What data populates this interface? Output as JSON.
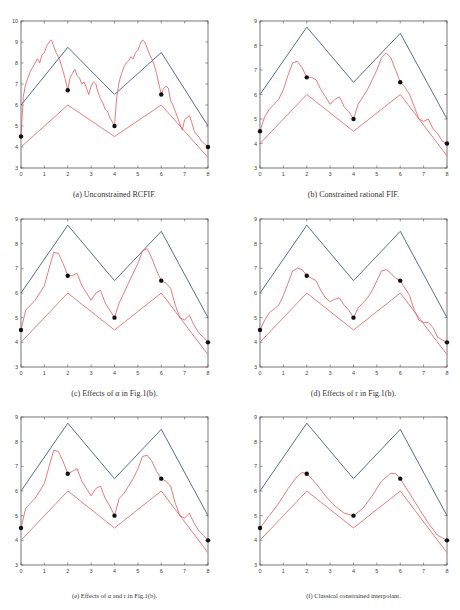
{
  "figure": {
    "point_color": "#111111",
    "upper_color": "#5a6a9a",
    "lower_color": "#e58080",
    "curve_color": "#e05a5a",
    "frame_color": "#555555"
  },
  "chart_data": [
    {
      "id": "a",
      "type": "line",
      "title": "",
      "caption": "(a) Unconstrained RCFIF.",
      "xlim": [
        0,
        8
      ],
      "ylim": [
        3,
        10
      ],
      "xticks": [
        0,
        1,
        2,
        3,
        4,
        5,
        6,
        7,
        8
      ],
      "yticks": [
        3,
        4,
        5,
        6,
        7,
        8,
        9,
        10
      ],
      "grid": false,
      "series": [
        {
          "name": "upper bound",
          "color": "#5a6a9a",
          "x": [
            0,
            2,
            4,
            6,
            8
          ],
          "y": [
            6,
            8.75,
            6.5,
            8.5,
            5
          ]
        },
        {
          "name": "lower bound",
          "color": "#e58080",
          "x": [
            0,
            2,
            4,
            6,
            8
          ],
          "y": [
            4,
            6,
            4.5,
            6,
            3.5
          ]
        },
        {
          "name": "fractal interpolant",
          "color": "#e05a5a",
          "x": [
            0,
            0.1,
            0.2,
            0.3,
            0.4,
            0.5,
            0.6,
            0.7,
            0.8,
            0.9,
            1.0,
            1.1,
            1.2,
            1.3,
            1.4,
            1.5,
            1.6,
            1.7,
            1.8,
            1.9,
            2.0,
            2.1,
            2.2,
            2.3,
            2.4,
            2.5,
            2.6,
            2.7,
            2.8,
            2.9,
            3.0,
            3.1,
            3.2,
            3.3,
            3.4,
            3.5,
            3.6,
            3.7,
            3.8,
            3.9,
            4.0,
            4.1,
            4.2,
            4.3,
            4.4,
            4.5,
            4.6,
            4.7,
            4.8,
            4.9,
            5.0,
            5.1,
            5.2,
            5.3,
            5.4,
            5.5,
            5.6,
            5.7,
            5.8,
            5.9,
            6.0,
            6.1,
            6.2,
            6.3,
            6.4,
            6.5,
            6.6,
            6.7,
            6.8,
            6.9,
            7.0,
            7.1,
            7.2,
            7.3,
            7.4,
            7.5,
            7.6,
            7.7,
            7.8,
            7.9,
            8.0
          ],
          "y": [
            4.5,
            6.4,
            7.0,
            7.3,
            7.6,
            7.8,
            8.0,
            8.2,
            8.0,
            8.4,
            8.5,
            8.8,
            9.0,
            9.1,
            8.8,
            8.5,
            8.3,
            8.0,
            7.6,
            7.2,
            6.7,
            7.3,
            7.5,
            7.7,
            7.4,
            7.3,
            7.0,
            7.1,
            6.8,
            6.5,
            6.9,
            7.1,
            7.0,
            6.6,
            6.3,
            6.1,
            5.8,
            5.7,
            5.4,
            5.2,
            5.0,
            6.4,
            7.1,
            7.5,
            7.8,
            8.0,
            8.1,
            8.3,
            8.2,
            8.5,
            8.6,
            8.9,
            9.1,
            9.0,
            8.7,
            8.4,
            8.2,
            7.9,
            7.5,
            7.0,
            6.5,
            6.8,
            6.9,
            6.8,
            6.2,
            6.0,
            5.7,
            5.4,
            5.1,
            4.8,
            5.3,
            5.4,
            5.5,
            5.2,
            4.8,
            4.6,
            4.5,
            4.3,
            4.2,
            4.1,
            4.0
          ]
        },
        {
          "name": "data points",
          "type": "scatter",
          "color": "#111111",
          "x": [
            0,
            2,
            4,
            6,
            8
          ],
          "y": [
            4.5,
            6.7,
            5,
            6.5,
            4
          ]
        }
      ]
    },
    {
      "id": "b",
      "type": "line",
      "caption": "(b) Constrained rational FIF.",
      "xlim": [
        0,
        8
      ],
      "ylim": [
        3,
        9
      ],
      "xticks": [
        0,
        1,
        2,
        3,
        4,
        5,
        6,
        7,
        8
      ],
      "yticks": [
        3,
        4,
        5,
        6,
        7,
        8,
        9
      ],
      "grid": false,
      "series": [
        {
          "name": "upper bound",
          "color": "#5a6a9a",
          "x": [
            0,
            2,
            4,
            6,
            8
          ],
          "y": [
            6,
            8.75,
            6.5,
            8.5,
            5
          ]
        },
        {
          "name": "lower bound",
          "color": "#e58080",
          "x": [
            0,
            2,
            4,
            6,
            8
          ],
          "y": [
            4,
            6,
            4.5,
            6,
            3.5
          ]
        },
        {
          "name": "fractal interpolant",
          "color": "#e05a5a",
          "x": [
            0,
            0.2,
            0.4,
            0.6,
            0.8,
            1.0,
            1.2,
            1.4,
            1.6,
            1.8,
            2.0,
            2.2,
            2.4,
            2.6,
            2.8,
            3.0,
            3.2,
            3.4,
            3.6,
            3.8,
            4.0,
            4.2,
            4.4,
            4.6,
            4.8,
            5.0,
            5.2,
            5.4,
            5.6,
            5.8,
            6.0,
            6.2,
            6.4,
            6.6,
            6.8,
            7.0,
            7.2,
            7.4,
            7.6,
            7.8,
            8.0
          ],
          "y": [
            4.5,
            5.1,
            5.4,
            5.6,
            5.8,
            6.2,
            6.8,
            7.3,
            7.35,
            7.1,
            6.7,
            6.7,
            6.6,
            6.2,
            5.9,
            5.6,
            5.8,
            5.9,
            5.5,
            5.3,
            5.0,
            5.6,
            5.9,
            6.2,
            6.6,
            7.0,
            7.5,
            7.7,
            7.5,
            7.0,
            6.5,
            6.3,
            6.0,
            5.5,
            5.0,
            4.9,
            5.0,
            4.6,
            4.4,
            4.1,
            4.0
          ]
        },
        {
          "name": "data points",
          "type": "scatter",
          "color": "#111111",
          "x": [
            0,
            2,
            4,
            6,
            8
          ],
          "y": [
            4.5,
            6.7,
            5,
            6.5,
            4
          ]
        }
      ]
    },
    {
      "id": "c",
      "type": "line",
      "caption": "(c) Effects of α in Fig.1(b).",
      "xlim": [
        0,
        8
      ],
      "ylim": [
        3,
        9
      ],
      "xticks": [
        0,
        1,
        2,
        3,
        4,
        5,
        6,
        7,
        8
      ],
      "yticks": [
        3,
        4,
        5,
        6,
        7,
        8,
        9
      ],
      "grid": false,
      "series": [
        {
          "name": "upper bound",
          "color": "#5a6a9a",
          "x": [
            0,
            2,
            4,
            6,
            8
          ],
          "y": [
            6,
            8.75,
            6.5,
            8.5,
            5
          ]
        },
        {
          "name": "lower bound",
          "color": "#e58080",
          "x": [
            0,
            2,
            4,
            6,
            8
          ],
          "y": [
            4,
            6,
            4.5,
            6,
            3.5
          ]
        },
        {
          "name": "fractal interpolant",
          "color": "#e05a5a",
          "x": [
            0,
            0.2,
            0.4,
            0.6,
            0.8,
            1.0,
            1.2,
            1.4,
            1.6,
            1.8,
            2.0,
            2.2,
            2.4,
            2.6,
            2.8,
            3.0,
            3.2,
            3.4,
            3.6,
            3.8,
            4.0,
            4.2,
            4.4,
            4.6,
            4.8,
            5.0,
            5.2,
            5.4,
            5.6,
            5.8,
            6.0,
            6.2,
            6.4,
            6.6,
            6.8,
            7.0,
            7.2,
            7.4,
            7.6,
            7.8,
            8.0
          ],
          "y": [
            4.5,
            5.3,
            5.5,
            5.7,
            6.0,
            6.3,
            7.0,
            7.65,
            7.6,
            7.2,
            6.7,
            6.7,
            6.8,
            6.3,
            6.0,
            5.7,
            6.0,
            6.1,
            5.6,
            5.3,
            5.0,
            5.6,
            6.0,
            6.4,
            6.8,
            7.2,
            7.7,
            7.8,
            7.4,
            6.9,
            6.5,
            6.4,
            6.2,
            5.5,
            5.0,
            4.9,
            5.1,
            4.7,
            4.4,
            4.2,
            4.0
          ]
        },
        {
          "name": "data points",
          "type": "scatter",
          "color": "#111111",
          "x": [
            0,
            2,
            4,
            6,
            8
          ],
          "y": [
            4.5,
            6.7,
            5,
            6.5,
            4
          ]
        }
      ]
    },
    {
      "id": "d",
      "type": "line",
      "caption": "(d) Effects of r in Fig.1(b).",
      "xlim": [
        0,
        8
      ],
      "ylim": [
        3,
        9
      ],
      "xticks": [
        0,
        1,
        2,
        3,
        4,
        5,
        6,
        7,
        8
      ],
      "yticks": [
        3,
        4,
        5,
        6,
        7,
        8,
        9
      ],
      "grid": false,
      "series": [
        {
          "name": "upper bound",
          "color": "#5a6a9a",
          "x": [
            0,
            2,
            4,
            6,
            8
          ],
          "y": [
            6,
            8.75,
            6.5,
            8.5,
            5
          ]
        },
        {
          "name": "lower bound",
          "color": "#e58080",
          "x": [
            0,
            2,
            4,
            6,
            8
          ],
          "y": [
            4,
            6,
            4.5,
            6,
            3.5
          ]
        },
        {
          "name": "fractal interpolant",
          "color": "#e05a5a",
          "x": [
            0,
            0.2,
            0.4,
            0.6,
            0.8,
            1.0,
            1.2,
            1.4,
            1.6,
            1.8,
            2.0,
            2.2,
            2.4,
            2.6,
            2.8,
            3.0,
            3.2,
            3.4,
            3.6,
            3.8,
            4.0,
            4.2,
            4.4,
            4.6,
            4.8,
            5.0,
            5.2,
            5.4,
            5.6,
            5.8,
            6.0,
            6.2,
            6.4,
            6.6,
            6.8,
            7.0,
            7.2,
            7.4,
            7.6,
            7.8,
            8.0
          ],
          "y": [
            4.5,
            4.9,
            5.2,
            5.35,
            5.5,
            5.9,
            6.4,
            6.9,
            7.0,
            6.95,
            6.7,
            6.6,
            6.5,
            6.1,
            5.8,
            5.65,
            5.75,
            5.8,
            5.5,
            5.3,
            5.0,
            5.4,
            5.6,
            5.8,
            6.1,
            6.5,
            6.9,
            6.95,
            6.8,
            6.6,
            6.5,
            6.2,
            5.9,
            5.3,
            4.9,
            4.8,
            4.8,
            4.6,
            4.2,
            4.1,
            4.0
          ]
        },
        {
          "name": "data points",
          "type": "scatter",
          "color": "#111111",
          "x": [
            0,
            2,
            4,
            6,
            8
          ],
          "y": [
            4.5,
            6.7,
            5,
            6.5,
            4
          ]
        }
      ]
    },
    {
      "id": "e",
      "type": "line",
      "caption": "(e) Effects of α and r in Fig.1(b).",
      "xlim": [
        0,
        8
      ],
      "ylim": [
        3,
        9
      ],
      "xticks": [
        0,
        1,
        2,
        3,
        4,
        5,
        6,
        7,
        8
      ],
      "yticks": [
        3,
        4,
        5,
        6,
        7,
        8,
        9
      ],
      "grid": false,
      "series": [
        {
          "name": "upper bound",
          "color": "#5a6a9a",
          "x": [
            0,
            2,
            4,
            6,
            8
          ],
          "y": [
            6,
            8.75,
            6.5,
            8.5,
            5
          ]
        },
        {
          "name": "lower bound",
          "color": "#e58080",
          "x": [
            0,
            2,
            4,
            6,
            8
          ],
          "y": [
            4,
            6,
            4.5,
            6,
            3.5
          ]
        },
        {
          "name": "fractal interpolant",
          "color": "#e05a5a",
          "x": [
            0,
            0.2,
            0.4,
            0.6,
            0.8,
            1.0,
            1.2,
            1.4,
            1.6,
            1.8,
            2.0,
            2.2,
            2.4,
            2.6,
            2.8,
            3.0,
            3.2,
            3.4,
            3.6,
            3.8,
            4.0,
            4.2,
            4.4,
            4.6,
            4.8,
            5.0,
            5.2,
            5.4,
            5.6,
            5.8,
            6.0,
            6.2,
            6.4,
            6.6,
            6.8,
            7.0,
            7.2,
            7.4,
            7.6,
            7.8,
            8.0
          ],
          "y": [
            4.5,
            5.3,
            5.5,
            5.7,
            6.0,
            6.3,
            7.0,
            7.65,
            7.6,
            7.2,
            6.7,
            6.8,
            6.9,
            6.4,
            6.1,
            5.8,
            6.1,
            6.2,
            5.7,
            5.4,
            5.0,
            5.7,
            5.9,
            6.2,
            6.5,
            6.9,
            7.4,
            7.45,
            7.2,
            6.8,
            6.5,
            6.4,
            6.2,
            5.5,
            5.0,
            4.9,
            5.1,
            4.7,
            4.4,
            4.2,
            4.0
          ]
        },
        {
          "name": "data points",
          "type": "scatter",
          "color": "#111111",
          "x": [
            0,
            2,
            4,
            6,
            8
          ],
          "y": [
            4.5,
            6.7,
            5,
            6.5,
            4
          ]
        }
      ]
    },
    {
      "id": "f",
      "type": "line",
      "caption": "(f) Classical constrained interpolant.",
      "xlim": [
        0,
        8
      ],
      "ylim": [
        3,
        9
      ],
      "xticks": [
        0,
        1,
        2,
        3,
        4,
        5,
        6,
        7,
        8
      ],
      "yticks": [
        3,
        4,
        5,
        6,
        7,
        8,
        9
      ],
      "grid": false,
      "series": [
        {
          "name": "upper bound",
          "color": "#5a6a9a",
          "x": [
            0,
            2,
            4,
            6,
            8
          ],
          "y": [
            6,
            8.75,
            6.5,
            8.5,
            5
          ]
        },
        {
          "name": "lower bound",
          "color": "#e58080",
          "x": [
            0,
            2,
            4,
            6,
            8
          ],
          "y": [
            4,
            6,
            4.5,
            6,
            3.5
          ]
        },
        {
          "name": "classical interpolant",
          "color": "#e05a5a",
          "x": [
            0,
            0.4,
            0.8,
            1.2,
            1.6,
            1.8,
            2.0,
            2.4,
            2.8,
            3.2,
            3.6,
            4.0,
            4.4,
            4.8,
            5.2,
            5.6,
            5.8,
            6.0,
            6.4,
            6.8,
            7.2,
            7.6,
            8.0
          ],
          "y": [
            4.5,
            5.0,
            5.5,
            6.1,
            6.6,
            6.75,
            6.7,
            6.3,
            5.8,
            5.4,
            5.1,
            5.0,
            5.3,
            5.8,
            6.4,
            6.72,
            6.7,
            6.5,
            5.9,
            5.3,
            4.7,
            4.2,
            4.0
          ]
        },
        {
          "name": "data points",
          "type": "scatter",
          "color": "#111111",
          "x": [
            0,
            2,
            4,
            6,
            8
          ],
          "y": [
            4.5,
            6.7,
            5,
            6.5,
            4
          ]
        }
      ]
    }
  ],
  "layout": {
    "panels": [
      {
        "id": "a",
        "left": 21,
        "top": 21,
        "width": 187,
        "height": 147,
        "caption_top": 190
      },
      {
        "id": "b",
        "left": 260,
        "top": 21,
        "width": 187,
        "height": 147,
        "caption_top": 190
      },
      {
        "id": "c",
        "left": 21,
        "top": 219,
        "width": 187,
        "height": 148,
        "caption_top": 389
      },
      {
        "id": "d",
        "left": 260,
        "top": 219,
        "width": 187,
        "height": 148,
        "caption_top": 389
      },
      {
        "id": "e",
        "left": 21,
        "top": 417,
        "width": 187,
        "height": 148,
        "caption_top": 592
      },
      {
        "id": "f",
        "left": 260,
        "top": 417,
        "width": 187,
        "height": 148,
        "caption_top": 592
      }
    ]
  }
}
